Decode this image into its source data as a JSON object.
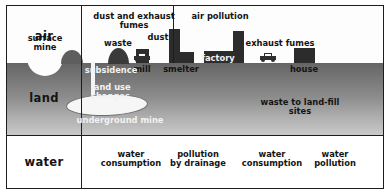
{
  "diagram": {
    "colors": {
      "air": "#fdfdfd",
      "land_top": "#656565",
      "land_bottom": "#c9c9c9",
      "water": "#ffffff",
      "ink": "#141414",
      "building": "#2c2c2c"
    },
    "bands": [
      {
        "key": "air",
        "label": "air"
      },
      {
        "key": "land",
        "label": "land"
      },
      {
        "key": "water",
        "label": "water"
      }
    ],
    "air_labels": [
      {
        "key": "surface-mine",
        "text": "surface\nmine"
      },
      {
        "key": "dust-exhaust",
        "text": "dust and exhaust\nfumes"
      },
      {
        "key": "waste",
        "text": "waste"
      },
      {
        "key": "dust",
        "text": "dust"
      },
      {
        "key": "air-pollution",
        "text": "air pollution"
      },
      {
        "key": "exhaust-fumes",
        "text": "exhaust fumes"
      }
    ],
    "structure_labels": [
      {
        "key": "mill",
        "text": "mill"
      },
      {
        "key": "smelter",
        "text": "smelter"
      },
      {
        "key": "factory",
        "text": "factory"
      },
      {
        "key": "house",
        "text": "house"
      }
    ],
    "land_labels": [
      {
        "key": "subsidence",
        "text": "subsidence"
      },
      {
        "key": "land-use-changes",
        "text": "land use\nchanges"
      },
      {
        "key": "underground-mine",
        "text": "underground mine"
      },
      {
        "key": "landfill",
        "text": "waste to land-fill sites"
      }
    ],
    "water_labels": [
      {
        "key": "water-consumption-1",
        "text": "water\nconsumption"
      },
      {
        "key": "pollution-drainage",
        "text": "pollution\nby drainage"
      },
      {
        "key": "water-consumption-2",
        "text": "water\nconsumption"
      },
      {
        "key": "water-pollution",
        "text": "water\npollution"
      }
    ],
    "buildings": [
      {
        "key": "mill-stack",
        "left": 129,
        "width": 13,
        "height": 14
      },
      {
        "key": "smelter-stack",
        "left": 162,
        "width": 11,
        "height": 34
      },
      {
        "key": "smelter-base",
        "left": 173,
        "width": 14,
        "height": 11
      },
      {
        "key": "factory-stack",
        "left": 226,
        "width": 11,
        "height": 32
      },
      {
        "key": "factory-base",
        "left": 197,
        "width": 29,
        "height": 12
      },
      {
        "key": "house-block",
        "left": 287,
        "width": 21,
        "height": 15
      }
    ],
    "vehicles": [
      {
        "key": "waste-truck-icon",
        "left": 127,
        "top": 47
      },
      {
        "key": "car-icon",
        "left": 253,
        "top": 47
      }
    ]
  }
}
